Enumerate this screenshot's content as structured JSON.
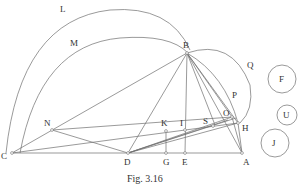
{
  "figure": {
    "caption": "Fig. 3.16",
    "colors": {
      "line": "#6f6f6f",
      "text": "#333333",
      "background": "#ffffff"
    },
    "points": {
      "B": {
        "label": "B",
        "x": 187,
        "y": 53
      },
      "C": {
        "label": "C",
        "x": 12,
        "y": 153
      },
      "N": {
        "label": "N",
        "x": 52,
        "y": 130
      },
      "D": {
        "label": "D",
        "x": 128,
        "y": 153
      },
      "G": {
        "label": "G",
        "x": 167,
        "y": 153
      },
      "E": {
        "label": "E",
        "x": 185,
        "y": 153
      },
      "A": {
        "label": "A",
        "x": 242,
        "y": 153
      },
      "K": {
        "label": "K",
        "x": 165,
        "y": 131
      },
      "I": {
        "label": "I",
        "x": 185,
        "y": 130
      },
      "S": {
        "label": "S",
        "x": 212,
        "y": 126
      },
      "O": {
        "label": "O",
        "x": 232,
        "y": 117
      },
      "H": {
        "label": "H",
        "x": 238,
        "y": 123
      }
    },
    "arc_labels": {
      "L": "L",
      "M": "M",
      "Q": "Q",
      "P": "P"
    },
    "circles": [
      {
        "label": "F",
        "cx": 282,
        "cy": 79,
        "r": 14
      },
      {
        "label": "U",
        "cx": 287,
        "cy": 115,
        "r": 10
      },
      {
        "label": "J",
        "cx": 275,
        "cy": 143,
        "r": 14
      }
    ]
  }
}
